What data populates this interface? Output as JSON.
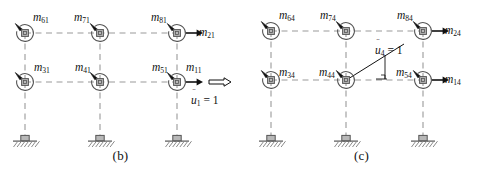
{
  "figure": {
    "colors": {
      "line": "#9a9a9a",
      "node_fill": "#b8b8b8",
      "node_stroke": "#555555",
      "arrow": "#111111",
      "text": "#111111",
      "hatch": "#8a8a8a"
    }
  },
  "panels": [
    {
      "id": "b",
      "caption": "(b)",
      "nodes": [
        {
          "name": "node-top-left",
          "x": 25,
          "y": 33,
          "moment_label": "m",
          "moment_sub": "61",
          "label_x": 33,
          "label_y": 12
        },
        {
          "name": "node-top-mid",
          "x": 100,
          "y": 33,
          "moment_label": "m",
          "moment_sub": "71",
          "label_x": 74,
          "label_y": 12
        },
        {
          "name": "node-top-right",
          "x": 177,
          "y": 33,
          "moment_label": "m",
          "moment_sub": "81",
          "label_x": 151,
          "label_y": 12
        },
        {
          "name": "node-mid-left",
          "x": 25,
          "y": 82,
          "moment_label": "m",
          "moment_sub": "31",
          "label_x": 34,
          "label_y": 62
        },
        {
          "name": "node-mid-mid",
          "x": 100,
          "y": 82,
          "moment_label": "m",
          "moment_sub": "41",
          "label_x": 75,
          "label_y": 62
        },
        {
          "name": "node-mid-right",
          "x": 177,
          "y": 82,
          "moment_label": "m",
          "moment_sub": "51",
          "label_x": 152,
          "label_y": 62
        }
      ],
      "force_arrows": [
        {
          "name": "force-top-right",
          "label": "m",
          "sub": "21",
          "label_x": 199,
          "label_y": 27
        },
        {
          "name": "force-mid-right",
          "label": "m",
          "sub": "11",
          "label_x": 186,
          "label_y": 62
        }
      ],
      "excitation": {
        "name": "unit-translation",
        "type": "translation",
        "var": "u",
        "sub": "1",
        "value": "= 1",
        "label_x": 191,
        "label_y": 95
      },
      "supports": [
        {
          "name": "support-left",
          "x": 25,
          "y": 140
        },
        {
          "name": "support-mid",
          "x": 100,
          "y": 140
        },
        {
          "name": "support-right",
          "x": 177,
          "y": 140
        }
      ]
    },
    {
      "id": "c",
      "caption": "(c)",
      "nodes": [
        {
          "name": "node-top-left",
          "x": 30,
          "y": 31,
          "moment_label": "m",
          "moment_sub": "64",
          "label_x": 38,
          "label_y": 10
        },
        {
          "name": "node-top-mid",
          "x": 105,
          "y": 31,
          "moment_label": "m",
          "moment_sub": "74",
          "label_x": 79,
          "label_y": 10
        },
        {
          "name": "node-top-right",
          "x": 182,
          "y": 31,
          "moment_label": "m",
          "moment_sub": "84",
          "label_x": 156,
          "label_y": 10
        },
        {
          "name": "node-mid-left",
          "x": 30,
          "y": 80,
          "moment_label": "m",
          "moment_sub": "34",
          "label_x": 38,
          "label_y": 67
        },
        {
          "name": "node-mid-mid",
          "x": 105,
          "y": 80,
          "moment_label": "m",
          "moment_sub": "44",
          "label_x": 78,
          "label_y": 67
        },
        {
          "name": "node-mid-right",
          "x": 182,
          "y": 80,
          "moment_label": "m",
          "moment_sub": "54",
          "label_x": 155,
          "label_y": 67
        }
      ],
      "force_arrows": [
        {
          "name": "force-top-right",
          "label": "m",
          "sub": "24",
          "label_x": 204,
          "label_y": 25
        },
        {
          "name": "force-mid-right",
          "label": "m",
          "sub": "14",
          "label_x": 204,
          "label_y": 74
        }
      ],
      "excitation": {
        "name": "unit-rotation",
        "type": "rotation",
        "var": "u",
        "sub": "4",
        "value": "= 1",
        "label_x": 134,
        "label_y": 45
      },
      "supports": [
        {
          "name": "support-left",
          "x": 30,
          "y": 140
        },
        {
          "name": "support-mid",
          "x": 105,
          "y": 140
        },
        {
          "name": "support-right",
          "x": 182,
          "y": 140
        }
      ]
    }
  ]
}
